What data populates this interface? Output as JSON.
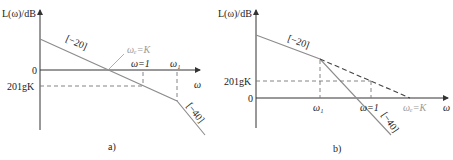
{
  "diagram_a": {
    "y_axis_label": "L(ω)/dB",
    "x_axis_label": "ω",
    "zero_label": "0",
    "level_label": "201gK",
    "crossover_label": "ωₑ=K",
    "omega_one_label": "ω=1",
    "omega1_label": "ω₁",
    "slope_20": "[−20]",
    "slope_40": "[−40]",
    "caption": "a)"
  },
  "diagram_b": {
    "y_axis_label": "L(ω)/dB",
    "x_axis_label": "ω",
    "zero_label": "0",
    "level_label": "201gK",
    "crossover_label": "ωₑ=K",
    "omega_one_label": "ω=1",
    "omega1_label": "ω₁",
    "slope_20": "[−20]",
    "slope_40": "[−40]",
    "caption": "b)"
  },
  "colors": {
    "line": "#8c8c8c",
    "axis": "#333333",
    "gray_label": "#9a9a9a"
  }
}
